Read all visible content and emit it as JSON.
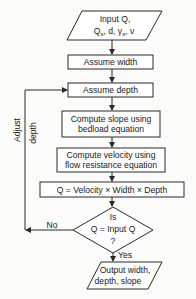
{
  "diagram": {
    "type": "flowchart",
    "nodes": {
      "input": {
        "shape": "parallelogram",
        "line1": "Input Q,",
        "line2_parts": [
          "Q",
          "s",
          ", d, γ",
          "s",
          ", ν"
        ]
      },
      "assume_width": {
        "shape": "rectangle",
        "label": "Assume width"
      },
      "assume_depth": {
        "shape": "rectangle",
        "label": "Assume depth"
      },
      "compute_slope": {
        "shape": "rectangle",
        "line1": "Compute slope using",
        "line2": "bedload equation"
      },
      "compute_velocity": {
        "shape": "rectangle",
        "line1": "Compute velocity using",
        "line2": "flow resistance equation"
      },
      "compute_q": {
        "shape": "rectangle",
        "label": "Q = Velocity × Width × Depth"
      },
      "decision": {
        "shape": "diamond",
        "line1": "Is",
        "line2": "Q = Input Q",
        "line3": "?"
      },
      "output": {
        "shape": "parallelogram",
        "line1": "Output width,",
        "line2": "depth, slope"
      }
    },
    "edges": {
      "no_label": "No",
      "yes_label": "Yes",
      "loop_label_1": "Adjust",
      "loop_label_2": "depth"
    },
    "colors": {
      "line": "#2a2a2a",
      "text": "#1a1a1a",
      "background": "#fbfbfa"
    }
  }
}
